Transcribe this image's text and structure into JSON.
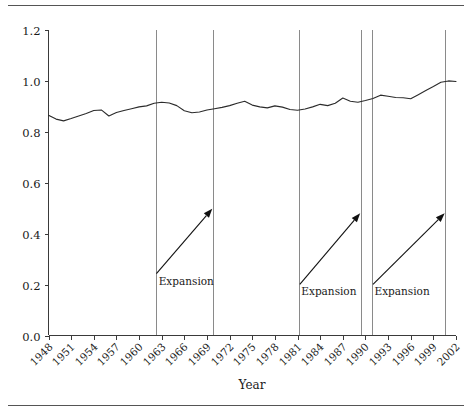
{
  "chart_data": {
    "type": "line",
    "title": "",
    "xlabel": "Year",
    "ylabel": "",
    "xlim": [
      1948,
      2002
    ],
    "ylim": [
      0.0,
      1.2
    ],
    "grid": false,
    "legend": null,
    "ytick_labels": [
      "0.0",
      "0.2",
      "0.4",
      "0.6",
      "0.8",
      "1.0",
      "1.2"
    ],
    "ytick_values": [
      0.0,
      0.2,
      0.4,
      0.6,
      0.8,
      1.0,
      1.2
    ],
    "xtick_labels": [
      "1948",
      "1951",
      "1954",
      "1957",
      "1960",
      "1963",
      "1966",
      "1969",
      "1972",
      "1975",
      "1978",
      "1981",
      "1984",
      "1987",
      "1990",
      "1993",
      "1996",
      "1999",
      "2002"
    ],
    "xtick_values": [
      1948,
      1951,
      1954,
      1957,
      1960,
      1963,
      1966,
      1969,
      1972,
      1975,
      1978,
      1981,
      1984,
      1987,
      1990,
      1993,
      1996,
      1999,
      2002
    ],
    "x": [
      1948,
      1949,
      1950,
      1951,
      1952,
      1953,
      1954,
      1955,
      1956,
      1957,
      1958,
      1959,
      1960,
      1961,
      1962,
      1963,
      1964,
      1965,
      1966,
      1967,
      1968,
      1969,
      1970,
      1971,
      1972,
      1973,
      1974,
      1975,
      1976,
      1977,
      1978,
      1979,
      1980,
      1981,
      1982,
      1983,
      1984,
      1985,
      1986,
      1987,
      1988,
      1989,
      1990,
      1991,
      1992,
      1993,
      1994,
      1995,
      1996,
      1997,
      1998,
      1999,
      2000,
      2001,
      2002
    ],
    "y": [
      0.865,
      0.85,
      0.843,
      0.852,
      0.862,
      0.872,
      0.884,
      0.886,
      0.862,
      0.876,
      0.884,
      0.891,
      0.898,
      0.902,
      0.912,
      0.916,
      0.913,
      0.903,
      0.883,
      0.875,
      0.878,
      0.886,
      0.891,
      0.896,
      0.903,
      0.912,
      0.92,
      0.905,
      0.898,
      0.894,
      0.902,
      0.897,
      0.888,
      0.885,
      0.89,
      0.898,
      0.908,
      0.903,
      0.912,
      0.933,
      0.92,
      0.916,
      0.923,
      0.931,
      0.944,
      0.94,
      0.935,
      0.934,
      0.93,
      0.946,
      0.962,
      0.978,
      0.995,
      1.0,
      0.998
    ],
    "recession_lines": [
      1962.2,
      1969.8,
      1981.2,
      1989.4,
      1990.9,
      2000.6
    ],
    "annotations": [
      {
        "label": "Expansion",
        "x": 1962.6,
        "y": 0.2,
        "arrow_from_x": 1962.3,
        "arrow_from_y": 0.243,
        "arrow_to_x": 1969.7,
        "arrow_to_y": 0.498
      },
      {
        "label": "Expansion",
        "x": 1981.5,
        "y": 0.158,
        "arrow_from_x": 1981.3,
        "arrow_from_y": 0.201,
        "arrow_to_x": 1989.3,
        "arrow_to_y": 0.48
      },
      {
        "label": "Expansion",
        "x": 1991.2,
        "y": 0.158,
        "arrow_from_x": 1991.0,
        "arrow_from_y": 0.201,
        "arrow_to_x": 2000.5,
        "arrow_to_y": 0.48
      }
    ]
  }
}
